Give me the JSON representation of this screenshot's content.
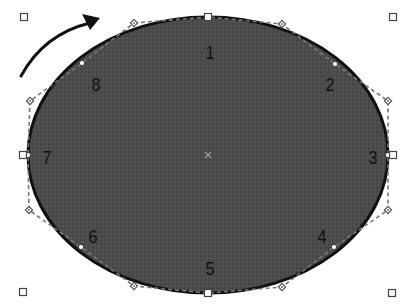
{
  "diagram": {
    "colors": {
      "fill": "#4a4a4a",
      "stroke": "#111111",
      "handle_stroke": "#555555",
      "control_dash": "#777777",
      "background": "#ffffff"
    },
    "ellipse": {
      "cx": 208,
      "cy": 155,
      "rx": 180,
      "ry": 138
    },
    "center_marker": {
      "x": 208,
      "y": 155,
      "glyph": "×"
    },
    "direction_arrow": {
      "from": [
        21,
        76
      ],
      "to": [
        100,
        18
      ],
      "meaning": "clockwise"
    },
    "nodes": [
      {
        "id": "1",
        "label": "1",
        "point": [
          208,
          17
        ],
        "label_pos": [
          210,
          52
        ]
      },
      {
        "id": "2",
        "label": "2",
        "point": [
          335,
          64
        ],
        "label_pos": [
          330,
          84
        ]
      },
      {
        "id": "3",
        "label": "3",
        "point": [
          388,
          155
        ],
        "label_pos": [
          373,
          157
        ]
      },
      {
        "id": "4",
        "label": "4",
        "point": [
          334,
          247
        ],
        "label_pos": [
          322,
          236
        ]
      },
      {
        "id": "5",
        "label": "5",
        "point": [
          208,
          293
        ],
        "label_pos": [
          210,
          268
        ]
      },
      {
        "id": "6",
        "label": "6",
        "point": [
          81,
          247
        ],
        "label_pos": [
          93,
          236
        ]
      },
      {
        "id": "7",
        "label": "7",
        "point": [
          28,
          155
        ],
        "label_pos": [
          47,
          157
        ]
      },
      {
        "id": "8",
        "label": "8",
        "point": [
          82,
          63
        ],
        "label_pos": [
          96,
          84
        ]
      }
    ],
    "control_points": [
      [
        134,
        23
      ],
      [
        282,
        24
      ],
      [
        388,
        101
      ],
      [
        388,
        210
      ],
      [
        282,
        287
      ],
      [
        134,
        286
      ],
      [
        29,
        210
      ],
      [
        30,
        101
      ]
    ],
    "bounding_handles": [
      [
        24,
        17
      ],
      [
        208,
        17
      ],
      [
        393,
        17
      ],
      [
        393,
        155
      ],
      [
        392,
        293
      ],
      [
        208,
        293
      ],
      [
        23,
        292
      ],
      [
        23,
        155
      ]
    ]
  }
}
